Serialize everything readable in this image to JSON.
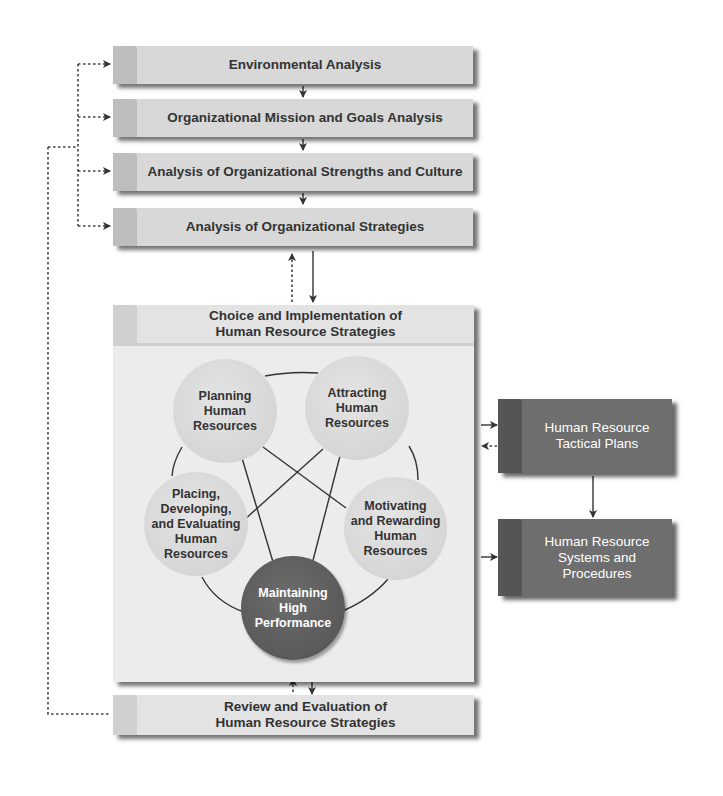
{
  "colors": {
    "light_box": "#d8d8d8",
    "light_tab": "#bdbdbd",
    "panel_bg": "#ececec",
    "light_circle": "#d6d6d6",
    "dark_circle": "#5a5a5a",
    "dark_box": "#6e6e6e",
    "dark_tab": "#555555",
    "text_dark": "#333333",
    "text_light": "#ffffff"
  },
  "analysis_steps": [
    {
      "label": "Environmental Analysis"
    },
    {
      "label": "Organizational Mission and Goals Analysis"
    },
    {
      "label": "Analysis of Organizational Strengths and Culture"
    },
    {
      "label": "Analysis of Organizational Strategies"
    }
  ],
  "choice_panel": {
    "title_line1": "Choice and Implementation of",
    "title_line2": "Human Resource Strategies",
    "circles": [
      {
        "lines": [
          "Planning",
          "Human",
          "Resources"
        ]
      },
      {
        "lines": [
          "Attracting",
          "Human",
          "Resources"
        ]
      },
      {
        "lines": [
          "Placing,",
          "Developing,",
          "and Evaluating",
          "Human",
          "Resources"
        ]
      },
      {
        "lines": [
          "Motivating",
          "and Rewarding",
          "Human",
          "Resources"
        ]
      },
      {
        "lines": [
          "Maintaining",
          "High",
          "Performance"
        ]
      }
    ]
  },
  "right_boxes": [
    {
      "line1": "Human Resource",
      "line2": "Tactical Plans"
    },
    {
      "line1": "Human Resource",
      "line2": "Systems and",
      "line3": "Procedures"
    }
  ],
  "review": {
    "line1": "Review and Evaluation of",
    "line2": "Human Resource Strategies"
  }
}
